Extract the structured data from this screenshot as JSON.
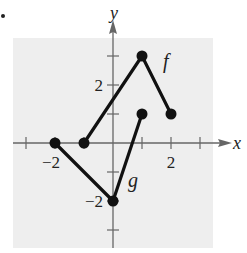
{
  "bullet": "•",
  "chart_data": {
    "type": "line",
    "title": "",
    "xlabel": "x",
    "ylabel": "y",
    "xlim": [
      -3,
      3
    ],
    "ylim": [
      -3,
      4
    ],
    "grid": false,
    "background": "#eeeeee",
    "x_ticks": [
      -3,
      -2,
      -1,
      1,
      2,
      3
    ],
    "y_ticks": [
      -3,
      -2,
      -1,
      1,
      2,
      3
    ],
    "x_tick_labels": [
      {
        "value": -2,
        "label": "−2"
      },
      {
        "value": 2,
        "label": "2"
      }
    ],
    "y_tick_labels": [
      {
        "value": 2,
        "label": "2"
      },
      {
        "value": -2,
        "label": "−2"
      }
    ],
    "series": [
      {
        "name": "f",
        "label": "f",
        "points": [
          [
            -1,
            0
          ],
          [
            1,
            3
          ],
          [
            2,
            1
          ]
        ],
        "color": "#111111",
        "markers": true
      },
      {
        "name": "g",
        "label": "g",
        "points": [
          [
            -2,
            0
          ],
          [
            0,
            -2
          ],
          [
            1,
            1
          ]
        ],
        "color": "#111111",
        "markers": true
      }
    ],
    "annotations": [
      {
        "text": "f",
        "near": [
          1.5,
          2.6
        ]
      },
      {
        "text": "g",
        "near": [
          0.65,
          -1.2
        ]
      }
    ]
  }
}
